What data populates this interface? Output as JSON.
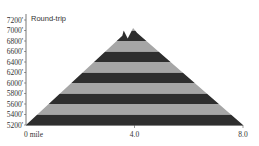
{
  "chart_data": {
    "type": "area",
    "title": "Round-trip",
    "xlabel": "",
    "ylabel": "",
    "x_unit": "mile",
    "x_ticks": [
      {
        "value": 0,
        "label": "0 mile"
      },
      {
        "value": 4.0,
        "label": "4.0"
      },
      {
        "value": 8.0,
        "label": "8.0"
      }
    ],
    "y_ticks": [
      5200,
      5400,
      5600,
      5800,
      6000,
      6200,
      6400,
      6600,
      6800,
      7000,
      7200
    ],
    "y_tick_suffix": "'",
    "xlim": [
      0,
      8.0
    ],
    "ylim": [
      5200,
      7200
    ],
    "grid": false,
    "legend": null,
    "band_step": 200,
    "colors": {
      "dark_band": "#2e2e2e",
      "light_band": "#a6a6a6",
      "axis": "#555555",
      "text": "#333333"
    },
    "profile": {
      "x": [
        0,
        3.55,
        3.6,
        3.75,
        3.95,
        4.1,
        8.0
      ],
      "y": [
        5200,
        6900,
        7000,
        6850,
        7050,
        6950,
        5200
      ]
    }
  }
}
